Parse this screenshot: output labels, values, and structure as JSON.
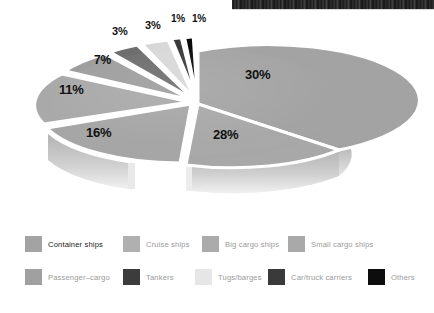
{
  "photo_strip": {
    "name": "photo-edge-strip",
    "description": "dark photographic image edge"
  },
  "chart_data": {
    "type": "pie",
    "title": "",
    "subtitle": "",
    "xlabel": "",
    "ylabel": "",
    "legend_position": "bottom",
    "three_d": true,
    "labels_suffix": "%",
    "categories": [
      "Container ships",
      "Cruise ships",
      "Big cargo ships",
      "Small cargo ships",
      "Passenger–cargo",
      "Tankers",
      "Tugs/barges",
      "Car/truck carriers",
      "Others"
    ],
    "values": [
      30,
      28,
      16,
      11,
      7,
      3,
      3,
      1,
      1
    ],
    "data_labels": [
      "30%",
      "28%",
      "16%",
      "11%",
      "7%",
      "3%",
      "3%",
      "1%",
      "1%"
    ],
    "colors": [
      "#a3a3a3",
      "#a8a8a8",
      "#a6a6a6",
      "#a9a9a9",
      "#9e9e9e",
      "#6e6e6e",
      "#d8d8d8",
      "#3a3a3a",
      "#0a0a0a"
    ]
  },
  "slice_labels": [
    {
      "text": "30%",
      "x": 245,
      "y": 68,
      "size": 13
    },
    {
      "text": "28%",
      "x": 213,
      "y": 128,
      "size": 13
    },
    {
      "text": "16%",
      "x": 86,
      "y": 126,
      "size": 13
    },
    {
      "text": "11%",
      "x": 59,
      "y": 83,
      "size": 13
    },
    {
      "text": "7%",
      "x": 94,
      "y": 54,
      "size": 12
    },
    {
      "text": "3%",
      "x": 112,
      "y": 26,
      "size": 11
    },
    {
      "text": "3%",
      "x": 145,
      "y": 20,
      "size": 11
    },
    {
      "text": "1%",
      "x": 171,
      "y": 14,
      "size": 10
    },
    {
      "text": "1%",
      "x": 192,
      "y": 14,
      "size": 10
    }
  ],
  "legend": {
    "rows": [
      {
        "items": [
          {
            "label": "Container ships",
            "color": "#a3a3a3",
            "x": 25,
            "emphasis": true
          },
          {
            "label": "Cruise ships",
            "color": "#b0b0b0",
            "x": 123,
            "emphasis": false
          },
          {
            "label": "Big cargo ships",
            "color": "#ababab",
            "x": 202,
            "emphasis": false
          },
          {
            "label": "Small cargo ships",
            "color": "#a9a9a9",
            "x": 288,
            "emphasis": false
          }
        ]
      },
      {
        "items": [
          {
            "label": "Passenger–cargo",
            "color": "#a0a0a0",
            "x": 25,
            "emphasis": false
          },
          {
            "label": "Tankers",
            "color": "#3c3c3c",
            "x": 123,
            "emphasis": false
          },
          {
            "label": "Tugs/barges",
            "color": "#e6e6e6",
            "x": 195,
            "emphasis": false
          },
          {
            "label": "Car/truck carriers",
            "color": "#3a3a3a",
            "x": 268,
            "emphasis": false
          },
          {
            "label": "Others",
            "color": "#0d0d0d",
            "x": 368,
            "emphasis": false
          }
        ]
      }
    ]
  }
}
